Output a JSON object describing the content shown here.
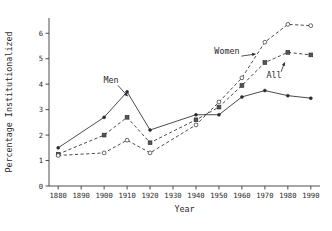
{
  "chart_data": {
    "type": "line",
    "title": "",
    "xlabel": "Year",
    "ylabel": "Percentage Institutionalized",
    "xlim": [
      1876,
      1994
    ],
    "ylim": [
      0,
      6.6
    ],
    "xticks": [
      1880,
      1890,
      1900,
      1910,
      1920,
      1930,
      1940,
      1950,
      1960,
      1970,
      1980,
      1990
    ],
    "yticks": [
      0,
      1,
      2,
      3,
      4,
      5,
      6
    ],
    "xtick_labels": [
      "1880",
      "1890",
      "1900",
      "1910",
      "1920",
      "1930",
      "1940",
      "1950",
      "1960",
      "1970",
      "1980",
      "1990"
    ],
    "ytick_labels": [
      "0",
      "1",
      "2",
      "3",
      "4",
      "5",
      "6"
    ],
    "grid": false,
    "legend": "inline-annotations",
    "annotations": [
      {
        "text": "Men",
        "x": 1903,
        "y": 4.05,
        "points_to_x": 1911,
        "points_to_y": 3.45
      },
      {
        "text": "Women",
        "x": 1948,
        "y": 5.2,
        "points_to_x": 1967,
        "points_to_y": 5.2
      },
      {
        "text": "All",
        "x": 1974,
        "y": 4.25,
        "points_to_x": 1979,
        "points_to_y": 4.95
      }
    ],
    "series": [
      {
        "name": "Men",
        "style": "solid",
        "marker": "filled-circle",
        "x": [
          1880,
          1900,
          1910,
          1920,
          1940,
          1950,
          1960,
          1970,
          1980,
          1990
        ],
        "values": [
          1.5,
          2.7,
          3.7,
          2.2,
          2.8,
          2.8,
          3.5,
          3.75,
          3.55,
          3.45
        ]
      },
      {
        "name": "All",
        "style": "dashed",
        "marker": "square",
        "x": [
          1880,
          1900,
          1910,
          1920,
          1940,
          1950,
          1960,
          1970,
          1980,
          1990
        ],
        "values": [
          1.25,
          2.0,
          2.7,
          1.7,
          2.6,
          3.1,
          3.95,
          4.85,
          5.25,
          5.15
        ]
      },
      {
        "name": "Women",
        "style": "dashed",
        "marker": "open-circle",
        "x": [
          1880,
          1900,
          1910,
          1920,
          1940,
          1950,
          1960,
          1970,
          1980,
          1990
        ],
        "values": [
          1.2,
          1.3,
          1.8,
          1.3,
          2.4,
          3.3,
          4.25,
          5.65,
          6.35,
          6.3
        ]
      }
    ],
    "colors": {
      "axis": "#3a3a3a",
      "ink": "#2a2a2a",
      "background": "#ffffff"
    }
  }
}
